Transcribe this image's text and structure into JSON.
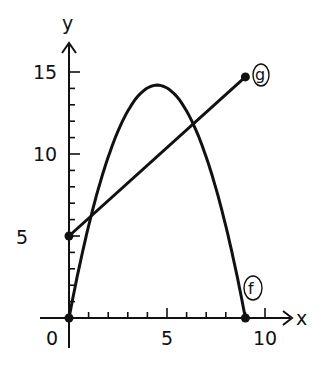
{
  "chart_data": {
    "type": "line",
    "title": "",
    "xlabel": "x",
    "ylabel": "y",
    "xlim": [
      0,
      10
    ],
    "ylim": [
      0,
      15
    ],
    "grid": false,
    "x_ticks": [
      0,
      1,
      2,
      3,
      4,
      5,
      6,
      7,
      8,
      9,
      10
    ],
    "x_tick_labels": [
      "0",
      "5",
      "10"
    ],
    "y_ticks": [
      0,
      1,
      2,
      3,
      4,
      5,
      6,
      7,
      8,
      9,
      10,
      11,
      12,
      13,
      14,
      15
    ],
    "y_tick_labels": [
      "5",
      "10",
      "15"
    ],
    "series": [
      {
        "name": "f",
        "kind": "parabola",
        "x": [
          0,
          1,
          2,
          3,
          4,
          4.5,
          5,
          6,
          7,
          8,
          9
        ],
        "values": [
          0,
          5.6,
          9.9,
          12.6,
          14.0,
          14.2,
          14.0,
          12.6,
          9.9,
          5.6,
          0
        ],
        "endpoints": [
          [
            0,
            0
          ],
          [
            9,
            0
          ]
        ]
      },
      {
        "name": "g",
        "kind": "line",
        "x": [
          0,
          9
        ],
        "values": [
          5,
          14.7
        ],
        "endpoints": [
          [
            0,
            5
          ],
          [
            9,
            14.7
          ]
        ]
      }
    ],
    "legend": "inline circled labels at curve ends"
  },
  "labels": {
    "x_axis": "x",
    "y_axis": "y",
    "origin": "0",
    "x5": "5",
    "x10": "10",
    "y5": "5",
    "y10": "10",
    "y15": "15",
    "f_label": "f",
    "g_label": "g"
  }
}
